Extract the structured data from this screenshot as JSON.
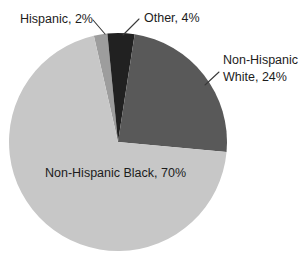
{
  "chart_data": {
    "type": "pie",
    "title": "",
    "legend": "none",
    "direction": "clockwise",
    "start_angle_deg": -12.8,
    "center": {
      "x": 118,
      "y": 142
    },
    "radius": 109,
    "categories": [
      "Hispanic",
      "Other",
      "Non-Hispanic White",
      "Non-Hispanic Black"
    ],
    "values": [
      2,
      4,
      24,
      70
    ],
    "slices": [
      {
        "label": "Hispanic",
        "value": 2,
        "display": "Hispanic, 2%",
        "color": "#9d9d9d"
      },
      {
        "label": "Other",
        "value": 4,
        "display": "Other, 4%",
        "color": "#212121"
      },
      {
        "label": "Non-Hispanic White",
        "value": 24,
        "display": "Non-Hispanic White, 24%",
        "color": "#595959"
      },
      {
        "label": "Non-Hispanic Black",
        "value": 70,
        "display": "Non-Hispanic Black, 70%",
        "color": "#c7c7c7"
      }
    ],
    "labels_style": "outside labels with leader lines for small slices; majority slice labeled inside",
    "text_color": "#1c1c1c"
  }
}
